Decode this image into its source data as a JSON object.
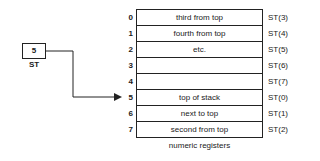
{
  "diagram": {
    "title": "",
    "stack_top_register": {
      "value": "5",
      "label": "ST"
    },
    "registers": [
      {
        "index": "0",
        "description": "third from top",
        "st_name": "ST(3)"
      },
      {
        "index": "1",
        "description": "fourth from top",
        "st_name": "ST(4)"
      },
      {
        "index": "2",
        "description": "etc.",
        "st_name": "ST(5)"
      },
      {
        "index": "3",
        "description": "",
        "st_name": "ST(6)"
      },
      {
        "index": "4",
        "description": "",
        "st_name": "ST(7)"
      },
      {
        "index": "5",
        "description": "top of stack",
        "st_name": "ST(0)"
      },
      {
        "index": "6",
        "description": "next to top",
        "st_name": "ST(1)"
      },
      {
        "index": "7",
        "description": "second from top",
        "st_name": "ST(2)"
      }
    ],
    "caption": "numeric registers",
    "arrow": {
      "from": "ST",
      "to_index": "5"
    },
    "colors": {
      "line": "#222222",
      "background": "#ffffff"
    }
  }
}
